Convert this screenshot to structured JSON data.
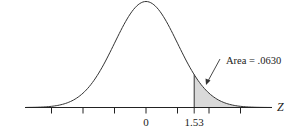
{
  "chart_data": {
    "type": "area",
    "title": "",
    "distribution": "standard normal",
    "xlabel": "Z",
    "ylabel": "",
    "x_tick_positions": [
      -3,
      -2,
      -1,
      0,
      1,
      1.53,
      2,
      3
    ],
    "x_tick_labels": [
      {
        "z": 0,
        "label": "0"
      },
      {
        "z": 1.53,
        "label": "1.53"
      }
    ],
    "shaded_region": {
      "from": 1.53,
      "to": 3,
      "area": 0.063
    },
    "annotation": "Area = .0630",
    "xlim": [
      -3.8,
      4.0
    ],
    "grid": false,
    "legend": null
  },
  "labels": {
    "axis": "Z",
    "tick_zero": "0",
    "tick_z": "1.53",
    "area": "Area = .0630"
  },
  "colors": {
    "curve": "#333333",
    "shade": "#d9d9d9",
    "axis": "#222222"
  }
}
